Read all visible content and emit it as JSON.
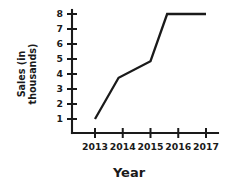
{
  "chart_data": {
    "type": "line",
    "title": "",
    "subtitle": "",
    "xlabel": "Year",
    "ylabel": "Sales (in thousands)",
    "ylabel_lines": [
      "Sales (in",
      "thousands)"
    ],
    "x": [
      2013,
      2013.85,
      2015,
      2015.6,
      2017
    ],
    "values": [
      1,
      3.75,
      4.85,
      8,
      8
    ],
    "series": [
      {
        "name": "Sales",
        "points": [
          {
            "x": 2013,
            "y": 1
          },
          {
            "x": 2013.85,
            "y": 3.75
          },
          {
            "x": 2015,
            "y": 4.85
          },
          {
            "x": 2015.6,
            "y": 8
          },
          {
            "x": 2017,
            "y": 8
          }
        ],
        "color": "#1a1a1a"
      }
    ],
    "xticks": [
      2013,
      2014,
      2015,
      2016,
      2017
    ],
    "xtick_labels": [
      "2013",
      "2014",
      "2015",
      "2016",
      "2017"
    ],
    "yticks": [
      1,
      2,
      3,
      4,
      5,
      6,
      7,
      8
    ],
    "ytick_labels": [
      "1",
      "2",
      "3",
      "4",
      "5",
      "6",
      "7",
      "8"
    ],
    "xlim": [
      2012.2,
      2017.2
    ],
    "ylim": [
      0,
      8.45
    ],
    "grid": false,
    "legend": false,
    "legend_position": "none",
    "line_color": "#1a1a1a",
    "axis_color": "#1a1a1a",
    "background_color": "#ffffff"
  }
}
